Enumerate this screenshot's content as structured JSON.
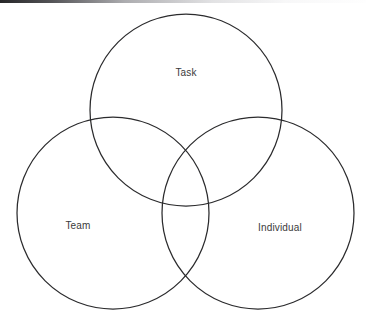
{
  "diagram": {
    "type": "venn",
    "title": "",
    "background_color": "#ffffff",
    "stroke_color": "#2b2b2d",
    "label_color": "#3a3a3c",
    "sets": [
      {
        "id": "task",
        "label": "Task",
        "center_x": 186,
        "center_y": 110,
        "radius": 96,
        "label_x": 186,
        "label_y": 73
      },
      {
        "id": "team",
        "label": "Team",
        "center_x": 113,
        "center_y": 213,
        "radius": 96,
        "label_x": 78,
        "label_y": 226
      },
      {
        "id": "individual",
        "label": "Individual",
        "center_x": 258,
        "center_y": 213,
        "radius": 96,
        "label_x": 280,
        "label_y": 228
      }
    ]
  }
}
